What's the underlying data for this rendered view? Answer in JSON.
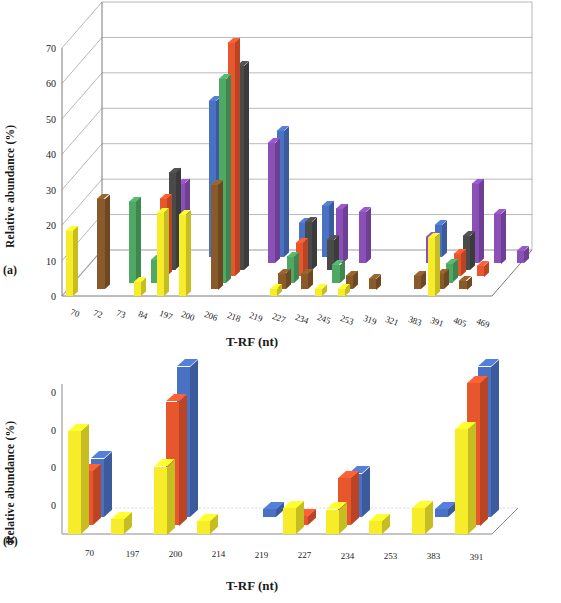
{
  "figure": {
    "panels": [
      {
        "tag": "(a)",
        "ylabel": "Relative abundance (%)",
        "xlabel": "T-RF (nt)"
      },
      {
        "tag": "(b)",
        "ylabel": "Relative abundance (%)",
        "xlabel": "T-RF (nt)"
      }
    ]
  },
  "chart_data": [
    {
      "type": "bar",
      "title": "",
      "panel": "(a)",
      "xlabel": "T-RF (nt)",
      "ylabel": "Relative abundance (%)",
      "ylim": [
        0,
        70
      ],
      "yticks": [
        0,
        10,
        20,
        30,
        40,
        50,
        60,
        70
      ],
      "grid": true,
      "legend": "none",
      "projection": "3d-bar",
      "categories": [
        "70",
        "72",
        "73",
        "84",
        "197",
        "200",
        "206",
        "218",
        "219",
        "227",
        "234",
        "245",
        "253",
        "319",
        "321",
        "383",
        "391",
        "405",
        "469"
      ],
      "series": [
        {
          "name": "Series 1",
          "color": "#F6EC2A",
          "values": [
            18.5,
            0,
            0,
            4.0,
            23.5,
            23.0,
            0,
            0,
            0,
            2.0,
            0,
            2.0,
            2.0,
            0,
            0,
            0,
            16.5,
            0,
            0
          ]
        },
        {
          "name": "Series 2",
          "color": "#8A5A2B",
          "values": [
            0,
            25.5,
            0,
            0,
            0,
            0,
            29.5,
            0,
            0,
            4.5,
            4.5,
            0,
            4.0,
            3.0,
            0,
            4.0,
            4.5,
            2.5,
            0
          ]
        },
        {
          "name": "Series 3",
          "color": "#4FA863",
          "values": [
            0,
            0,
            23.0,
            6.5,
            0,
            0,
            57.5,
            0,
            0,
            7.5,
            0,
            5.0,
            0,
            0,
            0,
            0,
            5.5,
            0,
            0
          ]
        },
        {
          "name": "Series 4",
          "color": "#E8562E",
          "values": [
            0,
            0,
            0,
            22.0,
            0,
            0,
            66.0,
            0,
            0,
            9.5,
            0,
            0,
            0,
            0,
            0,
            0,
            6.5,
            3.0,
            0
          ]
        },
        {
          "name": "Series 5",
          "color": "#4A4A4A",
          "values": [
            0,
            0,
            0,
            27.5,
            0,
            0,
            57.5,
            0,
            0,
            13.5,
            8.5,
            0,
            0,
            0,
            0,
            0,
            9.5,
            0,
            0
          ]
        },
        {
          "name": "Series 6",
          "color": "#8B4FB8",
          "values": [
            0,
            0,
            0,
            22.5,
            0,
            0,
            0,
            34.0,
            0,
            0,
            15.5,
            14.5,
            0,
            0,
            7.5,
            0,
            22.5,
            14.0,
            3.5
          ]
        },
        {
          "name": "Series 7",
          "color": "#4A72C4",
          "values": [
            0,
            0,
            0,
            0,
            44.0,
            0,
            0,
            35.5,
            9.5,
            14.5,
            0,
            0,
            0,
            0,
            9.0,
            0,
            0,
            0,
            0
          ]
        }
      ]
    },
    {
      "type": "bar",
      "title": "",
      "panel": "(b)",
      "xlabel": "T-RF (nt)",
      "ylabel": "Relative abundance (%)",
      "ylim": [
        0,
        40
      ],
      "yticks": [
        0,
        10,
        20,
        30,
        40
      ],
      "ytick_labels": [
        "0",
        "0",
        "0",
        "0"
      ],
      "grid": false,
      "legend": "none",
      "projection": "3d-bar",
      "categories": [
        "70",
        "197",
        "200",
        "214",
        "219",
        "227",
        "234",
        "253",
        "383",
        "391"
      ],
      "series": [
        {
          "name": "Series 1",
          "color": "#F6EC2A",
          "values": [
            27.5,
            4.0,
            18.0,
            3.5,
            0,
            7.0,
            6.5,
            3.5,
            7.0,
            28.0
          ]
        },
        {
          "name": "Series 2",
          "color": "#E8562E",
          "values": [
            14.5,
            0,
            33.0,
            0,
            0,
            2.5,
            12.5,
            0,
            0,
            38.0
          ]
        },
        {
          "name": "Series 3",
          "color": "#4A72C4",
          "values": [
            15.5,
            0,
            40.0,
            0,
            2.0,
            0,
            11.5,
            0,
            2.0,
            40.0
          ]
        }
      ]
    }
  ]
}
